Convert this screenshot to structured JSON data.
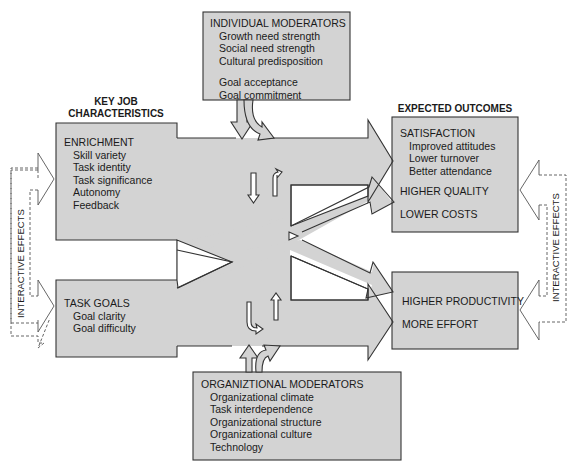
{
  "colors": {
    "box_fill": "#d3d3d3",
    "stroke": "#333333",
    "dashed_stroke": "#555555",
    "background": "#ffffff"
  },
  "key_job_characteristics": {
    "heading_line1": "KEY JOB",
    "heading_line2": "CHARACTERISTICS",
    "enrichment": {
      "title": "ENRICHMENT",
      "items": [
        "Skill variety",
        "Task identity",
        "Task significance",
        "Autonomy",
        "Feedback"
      ]
    },
    "task_goals": {
      "title": "TASK GOALS",
      "items": [
        "Goal clarity",
        "Goal difficulty"
      ]
    }
  },
  "individual_moderators": {
    "title": "INDIVIDUAL MODERATORS",
    "items": [
      "Growth need strength",
      "Social need strength",
      "Cultural predisposition"
    ],
    "items2": [
      "Goal acceptance",
      "Goal commitment"
    ]
  },
  "organizational_moderators": {
    "title": "ORGANIZTIONAL MODERATORS",
    "items": [
      "Organizational climate",
      "Task interdependence",
      "Organizational structure",
      "Organizational culture",
      "Technology"
    ]
  },
  "expected_outcomes": {
    "heading": "EXPECTED OUTCOMES",
    "box1": {
      "title": "SATISFACTION",
      "items": [
        "Improved attitudes",
        "Lower turnover",
        "Better attendance"
      ],
      "extra": [
        "HIGHER QUALITY",
        "LOWER COSTS"
      ]
    },
    "box2": {
      "items": [
        "HIGHER PRODUCTIVITY",
        "MORE EFFORT"
      ]
    }
  },
  "interactive_effects": {
    "left_label": "INTERACTIVE EFFECTS",
    "right_label": "INTERACTIVE EFFECTS"
  }
}
